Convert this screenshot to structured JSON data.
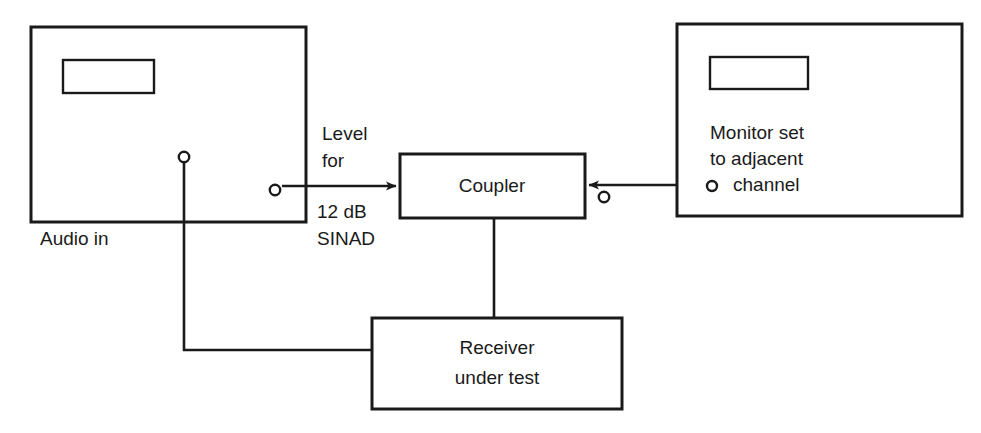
{
  "diagram": {
    "stroke_color": "#1a1a1a",
    "background_color": "#ffffff",
    "blocks": {
      "signal_generator": {
        "label": "Audio in",
        "display_window": "display-panel"
      },
      "coupler": {
        "label": "Coupler"
      },
      "receiver": {
        "label_line1": "Receiver",
        "label_line2": "under test"
      },
      "monitor": {
        "label_line1": "Monitor set",
        "label_line2": "to adjacent",
        "label_line3": "channel",
        "display_window": "display-panel"
      }
    },
    "annotations": {
      "level_line1": "Level",
      "level_line2": "for",
      "sinad_line1": "12 dB",
      "sinad_line2": "SINAD"
    },
    "terminals": {
      "audio_out": "audio-output-terminal",
      "rf_out": "rf-output-terminal",
      "monitor_out": "monitor-output-terminal",
      "monitor_in_marker": "monitor-channel-terminal"
    }
  }
}
